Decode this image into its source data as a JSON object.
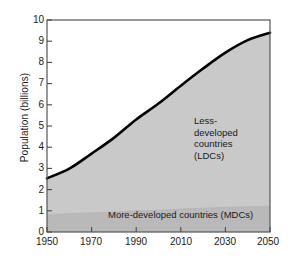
{
  "chart_data": {
    "type": "area",
    "title": "",
    "subtitle": "",
    "xlabel": "",
    "ylabel": "Population (billions)",
    "xlim": [
      1950,
      2050
    ],
    "ylim": [
      0,
      10
    ],
    "grid": false,
    "legend_position": "in-plot annotations",
    "x_ticks": [
      "1950",
      "1970",
      "1990",
      "2010",
      "2030",
      "2050"
    ],
    "y_ticks": [
      "0",
      "1",
      "2",
      "3",
      "4",
      "5",
      "6",
      "7",
      "8",
      "9",
      "10"
    ],
    "x": [
      1950,
      1960,
      1970,
      1980,
      1990,
      2000,
      2010,
      2020,
      2030,
      2040,
      2050
    ],
    "stacked": true,
    "series": [
      {
        "name": "More-developed countries (MDCs)",
        "values": [
          0.81,
          0.86,
          0.9,
          0.94,
          0.99,
          1.03,
          1.08,
          1.12,
          1.16,
          1.19,
          1.22
        ],
        "color": "#b9b9b9"
      },
      {
        "name": "Less-developed countries (LDCs)",
        "values": [
          1.72,
          2.13,
          2.8,
          3.5,
          4.32,
          5.03,
          5.82,
          6.59,
          7.3,
          7.86,
          8.18
        ],
        "color": "#c9c9c9"
      }
    ],
    "total_line": {
      "name": "Total world population",
      "values": [
        2.53,
        2.99,
        3.7,
        4.44,
        5.31,
        6.06,
        6.9,
        7.71,
        8.46,
        9.05,
        9.4
      ],
      "color": "#000000"
    },
    "annotations": [
      {
        "name": "ldc-annotation",
        "lines": [
          "Less-",
          "developed",
          "countries",
          "(LDCs)"
        ]
      },
      {
        "name": "mdc-annotation",
        "lines": [
          "More-developed countries (MDCs)"
        ]
      }
    ],
    "colors": {
      "ldc_fill": "#c9c9c9",
      "mdc_fill": "#b9b9b9",
      "line": "#000000",
      "axis": "#4a4a4a",
      "background": "#ffffff"
    }
  }
}
